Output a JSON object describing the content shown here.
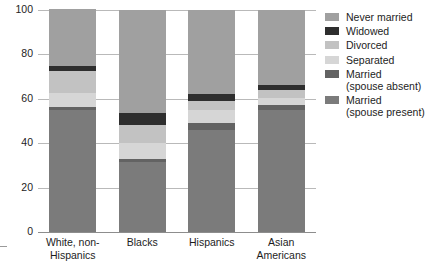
{
  "chart_data": {
    "type": "bar",
    "stacked": true,
    "title": "",
    "xlabel": "",
    "ylabel": "",
    "ylim": [
      0,
      100
    ],
    "yticks": [
      0,
      20,
      40,
      60,
      80,
      100
    ],
    "ytick_labels": [
      "0",
      "20",
      "40",
      "60",
      "80",
      "100"
    ],
    "grid": true,
    "legend_position": "right",
    "categories": [
      "White, non-\nHispanics",
      "Blacks",
      "Hispanics",
      "Asian\nAmericans"
    ],
    "series": [
      {
        "name": "Married\n(spouse present)",
        "color": "#7b7b7b",
        "values": [
          55,
          31.5,
          46,
          55
        ]
      },
      {
        "name": "Married\n(spouse absent)",
        "color": "#636363",
        "values": [
          1.5,
          1.5,
          3,
          2
        ]
      },
      {
        "name": "Separated",
        "color": "#d6d6d6",
        "values": [
          6,
          7,
          6,
          3.5
        ]
      },
      {
        "name": "Divorced",
        "color": "#c2c2c2",
        "values": [
          10,
          8,
          4,
          3.5
        ]
      },
      {
        "name": "Widowed",
        "color": "#2e2e2e",
        "values": [
          2.5,
          5.5,
          3,
          2
        ]
      },
      {
        "name": "Never married",
        "color": "#a0a0a0",
        "values": [
          25.5,
          46.5,
          38,
          34
        ]
      }
    ]
  },
  "legend": {
    "items": [
      {
        "label": "Never married",
        "color": "#a0a0a0"
      },
      {
        "label": "Widowed",
        "color": "#2e2e2e"
      },
      {
        "label": "Divorced",
        "color": "#c2c2c2"
      },
      {
        "label": "Separated",
        "color": "#d6d6d6"
      },
      {
        "label": "Married\n(spouse absent)",
        "color": "#636363"
      },
      {
        "label": "Married\n(spouse present)",
        "color": "#7b7b7b"
      }
    ]
  },
  "axes": {
    "y_max_label": "100",
    "y_min_label": "0"
  }
}
